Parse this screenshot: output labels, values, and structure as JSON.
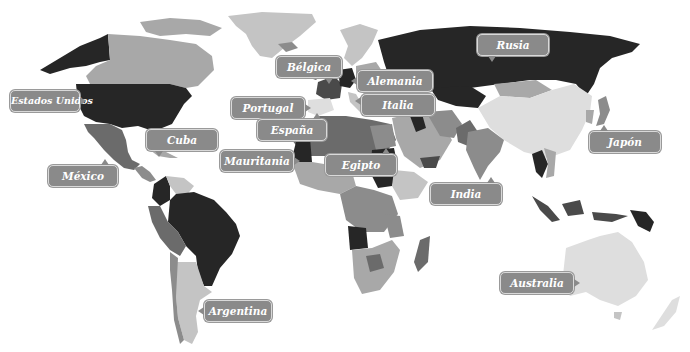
{
  "map": {
    "background": "#ffffff",
    "palette": {
      "darkest": "#262626",
      "dark": "#4a4a4a",
      "mid_dark": "#6b6b6b",
      "mid": "#8c8c8c",
      "mid_light": "#a8a8a8",
      "light": "#c4c4c4",
      "lightest": "#dedede"
    },
    "label_color": "#8a8a8a",
    "label_text_color": "#ffffff"
  },
  "labels": [
    {
      "id": "rusia",
      "text": "Rusia"
    },
    {
      "id": "belgica",
      "text": "Bélgica"
    },
    {
      "id": "alemania",
      "text": "Alemania"
    },
    {
      "id": "estados-unidos",
      "text": "Estados Unidos"
    },
    {
      "id": "portugal",
      "text": "Portugal"
    },
    {
      "id": "italia",
      "text": "Italia"
    },
    {
      "id": "espana",
      "text": "España"
    },
    {
      "id": "cuba",
      "text": "Cuba"
    },
    {
      "id": "japon",
      "text": "Japón"
    },
    {
      "id": "mauritania",
      "text": "Mauritania"
    },
    {
      "id": "egipto",
      "text": "Egipto"
    },
    {
      "id": "mexico",
      "text": "México"
    },
    {
      "id": "india",
      "text": "India"
    },
    {
      "id": "australia",
      "text": "Australia"
    },
    {
      "id": "argentina",
      "text": "Argentina"
    }
  ]
}
